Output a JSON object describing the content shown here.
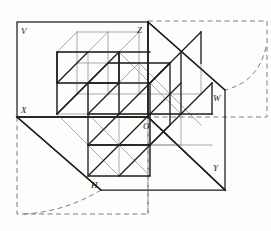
{
  "figure": {
    "background_color": "#fdfdfc",
    "line_color": "#1f1f1f",
    "light_line_color": "#8d8d8d",
    "dashed_color": "#6e6e6e"
  },
  "labels": {
    "v_plane": "V",
    "z_axis": "Z",
    "w_plane": "W",
    "x_axis": "X",
    "origin": "O",
    "h_plane": "H",
    "y_axis": "Y"
  },
  "label_positions": {
    "v_plane": {
      "x": 19,
      "y": 31
    },
    "z_axis": {
      "x": 138,
      "y": 31
    },
    "w_plane": {
      "x": 215,
      "y": 100
    },
    "x_axis": {
      "x": 20,
      "y": 112
    },
    "origin": {
      "x": 144,
      "y": 128
    },
    "h_plane": {
      "x": 92,
      "y": 187
    },
    "y_axis": {
      "x": 214,
      "y": 170
    }
  },
  "geometry": {
    "origin": {
      "x": 148,
      "y": 117
    },
    "oblique_dx": -20,
    "oblique_dy": 20,
    "cell_width": 31,
    "cell_height": 31,
    "grid_divisions": 2,
    "v_plane_rect": {
      "x": 17,
      "y": 22,
      "width": 131,
      "height": 95
    },
    "h_plane_corners": [
      {
        "x": 17,
        "y": 117
      },
      {
        "x": 148,
        "y": 117
      },
      {
        "x": 225,
        "y": 190
      },
      {
        "x": 101,
        "y": 190
      }
    ],
    "w_plane_corners": [
      {
        "x": 148,
        "y": 22
      },
      {
        "x": 225,
        "y": 90
      },
      {
        "x": 225,
        "y": 190
      },
      {
        "x": 148,
        "y": 117
      }
    ],
    "dashed_rect_top_right": {
      "x": 190,
      "y": 21,
      "width": 77,
      "height": 96
    },
    "dashed_rect_bottom_left": {
      "x": 17,
      "y": 117,
      "width": 131,
      "height": 98
    },
    "arc_top_right": {
      "from": {
        "x": 267,
        "y": 50
      },
      "to": {
        "x": 225,
        "y": 90
      }
    },
    "arc_bottom_left": {
      "from": {
        "x": 24,
        "y": 214
      },
      "to": {
        "x": 101,
        "y": 190
      }
    }
  },
  "annotations": {
    "projection_type": "oblique",
    "cube_count": 8
  }
}
